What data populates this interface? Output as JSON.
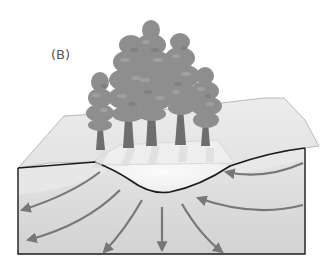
{
  "figure": {
    "panel_label": "(B)",
    "colors": {
      "surface_top": "#e4e4e4",
      "surface_edge": "#a8a8a8",
      "depression_fill": "#f6f6f6",
      "upper_layer": "#e2e2e2",
      "lower_layer": "#d4d4d4",
      "ground_line": "#1a1a1a",
      "arrow": "#777777",
      "tree_foliage": "#8e8e8e",
      "tree_trunk": "#6e6e6e"
    },
    "flow_arrows": {
      "inflow_count": 2,
      "outflow_count": 5
    }
  }
}
